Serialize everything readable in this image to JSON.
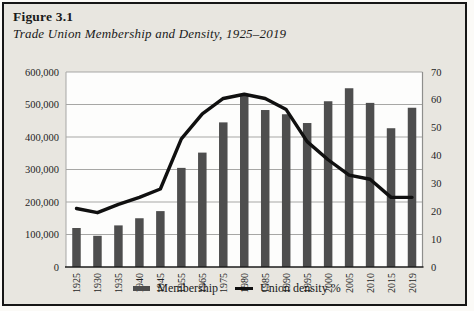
{
  "figure": {
    "label": "Figure 3.1",
    "caption": "Trade Union Membership and Density, 1925–2019"
  },
  "legend": {
    "membership_label": "Membership",
    "density_label": "Union density %"
  },
  "chart_data": {
    "type": "combo",
    "title": "Trade Union Membership and Density, 1925–2019",
    "categories": [
      "1925",
      "1930",
      "1935",
      "1940",
      "1945",
      "1955",
      "1965",
      "1975",
      "1980",
      "1985",
      "1990",
      "1995",
      "2000",
      "2005",
      "2010",
      "2015",
      "2019"
    ],
    "series": [
      {
        "name": "Membership",
        "kind": "bar",
        "axis": "left",
        "color": "#4e4e4e",
        "values": [
          120000,
          96000,
          128000,
          150000,
          172000,
          305000,
          352000,
          445000,
          530000,
          483000,
          470000,
          443000,
          510000,
          550000,
          505000,
          427000,
          490000
        ]
      },
      {
        "name": "Union density %",
        "kind": "line",
        "axis": "right",
        "color": "#101010",
        "values": [
          21,
          19.5,
          22.5,
          25,
          28,
          46,
          55,
          60.5,
          62,
          60.5,
          56.5,
          45,
          38.5,
          33,
          31.5,
          25,
          25
        ]
      }
    ],
    "left_axis": {
      "min": 0,
      "max": 600000,
      "step": 100000,
      "tick_labels": [
        "0",
        "100,000",
        "200,000",
        "300,000",
        "400,000",
        "500,000",
        "600,000"
      ]
    },
    "right_axis": {
      "min": 0,
      "max": 70,
      "step": 10,
      "tick_labels": [
        "0",
        "10",
        "20",
        "30",
        "40",
        "50",
        "60",
        "70"
      ]
    },
    "grid": "horizontal",
    "legend_position": "bottom"
  },
  "colors": {
    "figure_bg": "#e8e6e0",
    "plot_bg": "#fdfdfc",
    "grid": "#a7a7a5",
    "axis": "#1c1c1c",
    "text": "#1f1f1f",
    "border": "#161616"
  }
}
